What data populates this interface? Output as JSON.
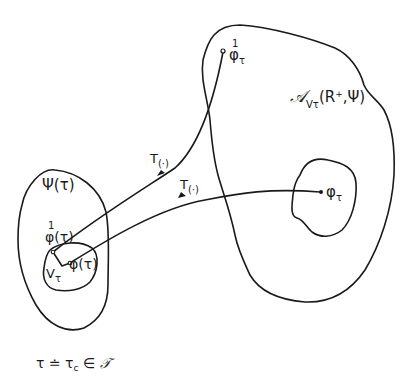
{
  "diagram": {
    "colors": {
      "stroke": "#1a1a1a",
      "background": "#ffffff"
    },
    "regions": [
      {
        "id": "psi-tau",
        "label": "Ψ(τ)"
      },
      {
        "id": "inner-left",
        "label": ""
      },
      {
        "id": "attainable-set",
        "label_main": "𝒜",
        "label_sub": "Vτ",
        "label_args": "(R",
        "label_sup": "+",
        "label_tail": ",Ψ)"
      },
      {
        "id": "inner-right",
        "label": ""
      }
    ],
    "points": {
      "phi1_tau_fn": {
        "base": "φ(τ)",
        "accent": "1"
      },
      "phi_tau_fn": {
        "label": "φ(τ)"
      },
      "v_tau": {
        "base": "V",
        "sub": "τ"
      },
      "phi1_target": {
        "base": "φ",
        "sub": "τ",
        "accent": "1"
      },
      "phi_target": {
        "base": "φ",
        "sub": "τ"
      }
    },
    "trajectories": [
      {
        "id": "upper",
        "label_base": "T",
        "label_sub": "(·)",
        "from": "phi1_tau_fn",
        "to": "phi1_target"
      },
      {
        "id": "lower",
        "label_base": "T",
        "label_sub": "(·)",
        "from": "phi_tau_fn",
        "to": "phi_target"
      }
    ],
    "caption": {
      "lhs": "τ",
      "eq": " ≐ ",
      "rhs_base": "τ",
      "rhs_sub": "c",
      "in": " ∈ ",
      "set": "𝒯"
    }
  }
}
